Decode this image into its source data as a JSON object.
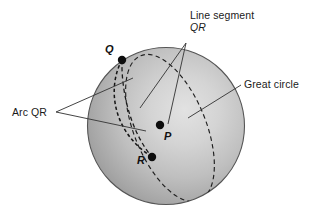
{
  "figure": {
    "background_color": "#ffffff",
    "labels": {
      "line_segment_l1": "Line segment",
      "line_segment_l2": "QR",
      "arc_qr": "Arc QR",
      "great_circle": "Great circle"
    },
    "points": [
      {
        "name": "Q",
        "label": "Q",
        "x": 122,
        "y": 60
      },
      {
        "name": "P",
        "label": "P",
        "x": 160,
        "y": 125
      },
      {
        "name": "R",
        "label": "R",
        "x": 152,
        "y": 157
      }
    ],
    "sphere": {
      "center_x": 166,
      "center_y": 126,
      "radius": 79,
      "fill_light": "#d2d2d2",
      "fill_dark": "#8d8d8d",
      "stroke": "#4a4a4a"
    },
    "colors": {
      "line": "#333333",
      "dash": "#1c1c1c",
      "text": "#1a1a1a",
      "point": "#101010"
    },
    "leaders": {
      "line_segment_apex_x": 186,
      "line_segment_apex_y": 43,
      "arc_apex_x": 56,
      "arc_apex_y": 112,
      "great_circle_apex_x": 241,
      "great_circle_apex_y": 85
    }
  }
}
